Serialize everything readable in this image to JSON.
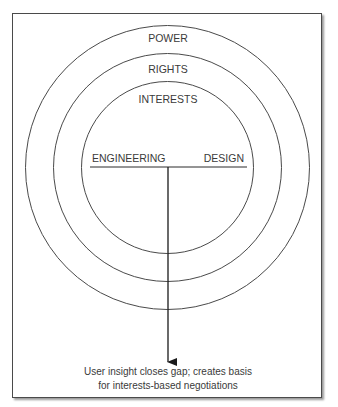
{
  "diagram": {
    "rings": [
      {
        "id": "outer",
        "label": "POWER"
      },
      {
        "id": "middle",
        "label": "RIGHTS"
      },
      {
        "id": "inner",
        "label": "INTERESTS"
      }
    ],
    "divider": {
      "left_label": "ENGINEERING",
      "right_label": "DESIGN"
    },
    "caption": {
      "line1": "User insight closes gap; creates basis",
      "line2": "for interests-based negotiations"
    },
    "colors": {
      "stroke": "#3a3a3a",
      "text": "#3a3a3a"
    }
  }
}
